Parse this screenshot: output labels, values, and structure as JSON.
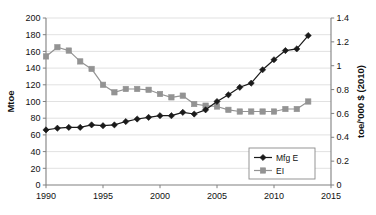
{
  "chart_data": {
    "type": "line",
    "title": "",
    "xlabel": "",
    "ylabel": "Mtoe",
    "y2label": "toe/'000 $ (2010)",
    "xlim": [
      1990,
      2015
    ],
    "ylim": [
      0,
      200
    ],
    "y2lim": [
      0,
      1.4
    ],
    "xticks": [
      1990,
      1995,
      2000,
      2005,
      2010,
      2015
    ],
    "xtick_labels": [
      "1990",
      "1995",
      "2000",
      "2005",
      "2010",
      "2015"
    ],
    "yticks": [
      0,
      20,
      40,
      60,
      80,
      100,
      120,
      140,
      160,
      180,
      200
    ],
    "ytick_labels": [
      "0",
      "20",
      "40",
      "60",
      "80",
      "100",
      "120",
      "140",
      "160",
      "180",
      "200"
    ],
    "y2ticks": [
      0,
      0.2,
      0.4,
      0.6,
      0.8,
      1,
      1.2,
      1.4
    ],
    "y2tick_labels": [
      "0",
      "0.2",
      "0.4",
      "0.6",
      "0.8",
      "1",
      "1.2",
      "1.4"
    ],
    "grid": true,
    "grid_axis": "y",
    "legend_position": "lower right",
    "x": [
      1990,
      1991,
      1992,
      1993,
      1994,
      1995,
      1996,
      1997,
      1998,
      1999,
      2000,
      2001,
      2002,
      2003,
      2004,
      2005,
      2006,
      2007,
      2008,
      2009,
      2010,
      2011,
      2012,
      2013
    ],
    "series": [
      {
        "name": "Mfg E",
        "axis": "left",
        "unit": "Mtoe",
        "color": "#1a1a1a",
        "marker": "diamond",
        "values": [
          66,
          68,
          69,
          69,
          72,
          71,
          72,
          76,
          79,
          81,
          83,
          83,
          87,
          85,
          90,
          100,
          108,
          117,
          122,
          138,
          150,
          161,
          163,
          179
        ]
      },
      {
        "name": "EI",
        "axis": "right",
        "unit": "toe/'000 $ (2010)",
        "color": "#939393",
        "marker": "square",
        "values_left_scale": [
          154,
          165,
          161,
          148,
          139,
          120,
          111,
          115,
          115,
          114,
          109,
          105,
          107,
          97,
          95,
          94,
          90,
          88,
          88,
          88,
          88,
          91,
          91,
          100
        ],
        "values": [
          1.078,
          1.155,
          1.127,
          1.036,
          0.973,
          0.84,
          0.777,
          0.805,
          0.805,
          0.798,
          0.763,
          0.735,
          0.749,
          0.679,
          0.665,
          0.658,
          0.63,
          0.616,
          0.616,
          0.616,
          0.616,
          0.637,
          0.637,
          0.7
        ]
      }
    ]
  },
  "legend": {
    "entries": [
      {
        "label": "Mfg E"
      },
      {
        "label": "EI"
      }
    ]
  },
  "colors": {
    "mfg_e": "#1a1a1a",
    "ei": "#939393",
    "grid": "#d9d9d9",
    "axis": "#808080",
    "text": "#111111"
  }
}
